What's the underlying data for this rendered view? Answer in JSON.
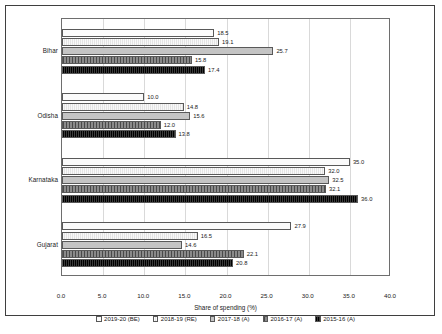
{
  "chart_data": {
    "type": "bar",
    "orientation": "horizontal",
    "title": "",
    "xlabel": "Share of spending (%)",
    "ylabel": "",
    "xlim": [
      0.0,
      40.0
    ],
    "xticks": [
      "0.0",
      "5.0",
      "10.0",
      "15.0",
      "20.0",
      "25.0",
      "30.0",
      "35.0",
      "40.0"
    ],
    "grid": true,
    "legend_position": "bottom",
    "categories": [
      "Bihar",
      "Odisha",
      "Karnataka",
      "Gujarat"
    ],
    "series": [
      {
        "name": "2019-20 (BE)",
        "values": [
          18.5,
          10.0,
          35.0,
          27.9
        ]
      },
      {
        "name": "2018-19 (RE)",
        "values": [
          19.1,
          14.8,
          32.0,
          16.5
        ]
      },
      {
        "name": "2017-18 (A)",
        "values": [
          25.7,
          15.6,
          32.5,
          14.6
        ]
      },
      {
        "name": "2016-17 (A)",
        "values": [
          15.8,
          12.0,
          32.1,
          22.1
        ]
      },
      {
        "name": "2015-16 (A)",
        "values": [
          17.4,
          13.8,
          36.0,
          20.8
        ]
      }
    ]
  }
}
